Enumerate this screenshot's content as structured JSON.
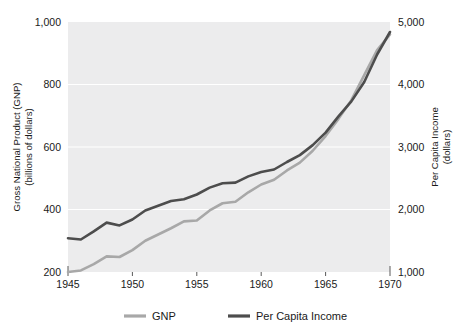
{
  "chart_data": {
    "type": "line",
    "title": "",
    "subtitle": "",
    "xlabel": "",
    "ylabel": "Gross National Product (GNP) (billions of dollars)",
    "y2label": "Per Capita Income (dollars)",
    "grid": true,
    "legend_position": "bottom",
    "xlim": [
      1945,
      1970
    ],
    "ylim": [
      200,
      1000
    ],
    "y2lim": [
      1000,
      5000
    ],
    "xticks": [
      "1945",
      "1950",
      "1955",
      "1960",
      "1965",
      "1970"
    ],
    "xtick_values": [
      1945,
      1950,
      1955,
      1960,
      1965,
      1970
    ],
    "yticks": [
      "200",
      "400",
      "600",
      "800",
      "1,000"
    ],
    "ytick_values": [
      200,
      400,
      600,
      800,
      1000
    ],
    "y2ticks": [
      "1,000",
      "2,000",
      "3,000",
      "4,000",
      "5,000"
    ],
    "y2tick_values": [
      1000,
      2000,
      3000,
      4000,
      5000
    ],
    "x": [
      1945,
      1946,
      1947,
      1948,
      1949,
      1950,
      1951,
      1952,
      1953,
      1954,
      1955,
      1956,
      1957,
      1958,
      1959,
      1960,
      1961,
      1962,
      1963,
      1964,
      1965,
      1966,
      1967,
      1968,
      1969,
      1970
    ],
    "series": [
      {
        "name": "GNP",
        "axis": "left",
        "color": "#a8a8a8",
        "units": "billions of dollars",
        "values": [
          200,
          205,
          225,
          250,
          248,
          270,
          300,
          320,
          340,
          362,
          365,
          397,
          420,
          425,
          455,
          480,
          495,
          525,
          550,
          588,
          635,
          690,
          750,
          830,
          910,
          960
        ]
      },
      {
        "name": "Per Capita Income",
        "axis": "right",
        "color": "#4d4d4d",
        "units": "dollars",
        "values": [
          1540,
          1520,
          1650,
          1790,
          1745,
          1840,
          1985,
          2060,
          2135,
          2165,
          2240,
          2350,
          2420,
          2430,
          2530,
          2600,
          2640,
          2760,
          2870,
          3030,
          3230,
          3490,
          3730,
          4040,
          4480,
          4840
        ]
      }
    ],
    "legend": [
      {
        "label": "GNP",
        "color": "#a8a8a8"
      },
      {
        "label": "Per Capita Income",
        "color": "#4d4d4d"
      }
    ]
  },
  "axes": {
    "left": {
      "title_line1": "Gross National Product (GNP)",
      "title_line2": "(billions of dollars)"
    },
    "right": {
      "title_line1": "Per Capita Income",
      "title_line2": "(dollars)"
    }
  },
  "colors": {
    "plot_background": "#ececed",
    "gridline": "#ffffff",
    "gnp_line": "#a8a8a8",
    "per_capita_line": "#4d4d4d",
    "text": "#1a1a1a"
  }
}
